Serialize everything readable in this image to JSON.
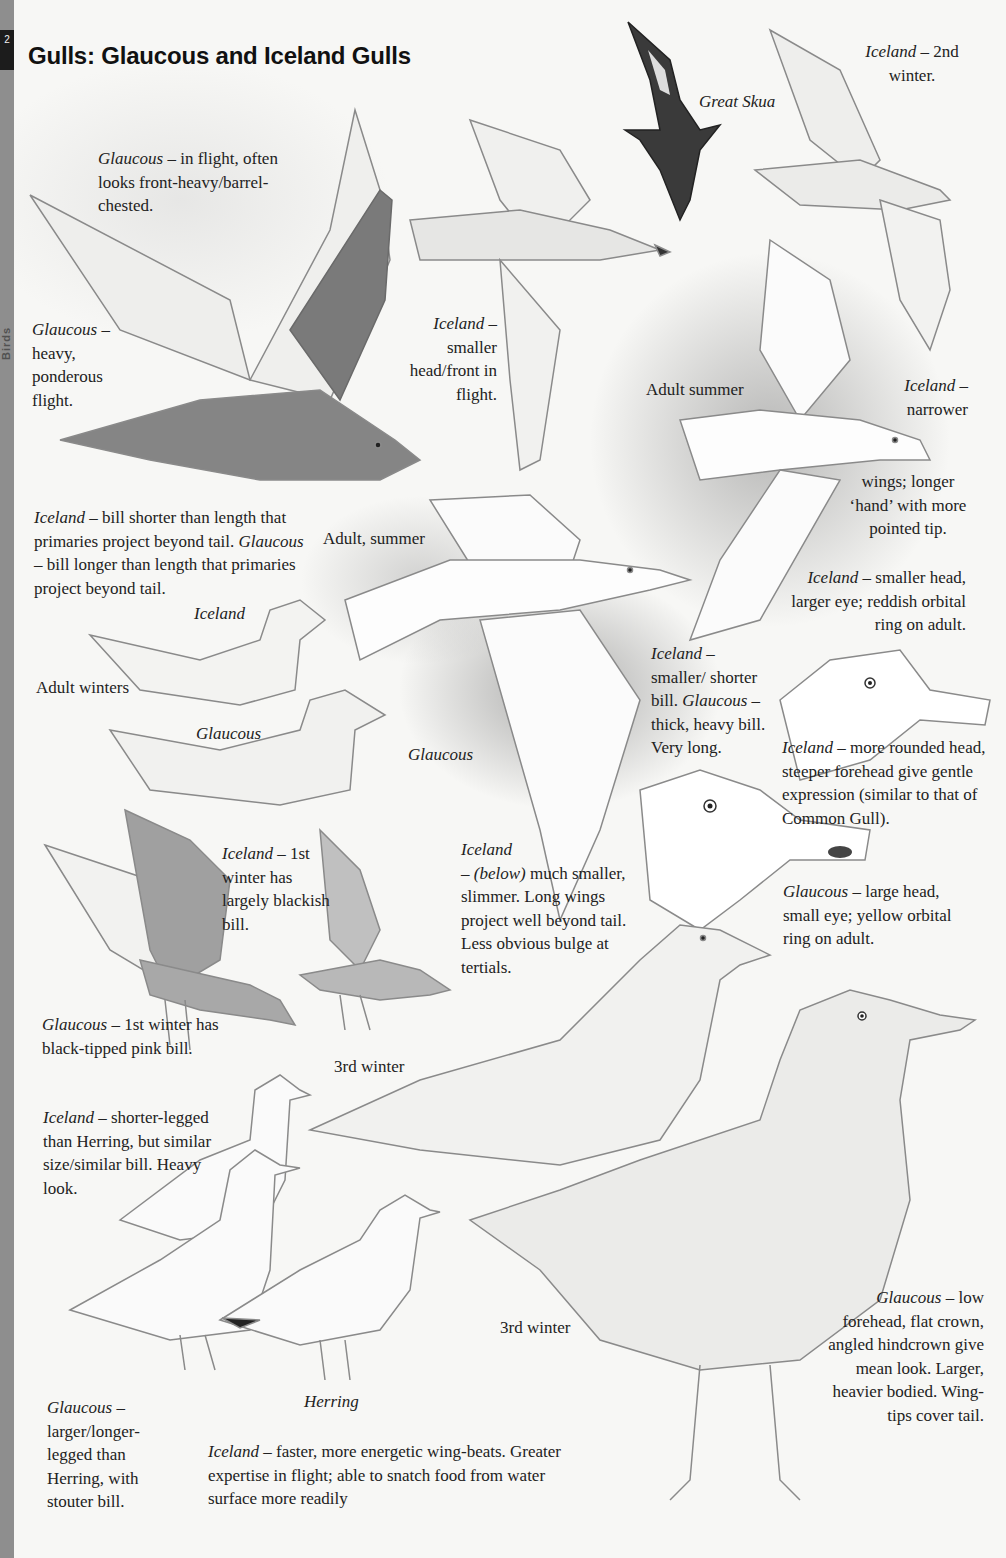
{
  "page": {
    "page_number": "2",
    "section_tab": "Birds",
    "title": "Gulls: Glaucous and Iceland Gulls"
  },
  "notes": {
    "glaucous_flight": {
      "species": "Glaucous",
      "text": " – in flight, often looks front-heavy/barrel-chested."
    },
    "glaucous_heavy": {
      "species": "Glaucous",
      "text": " – heavy, ponderous flight."
    },
    "iceland_smaller_head": {
      "species": "Iceland",
      "text": " – smaller head/front in flight."
    },
    "great_skua": {
      "label": "Great Skua"
    },
    "iceland_2nd_winter": {
      "species": "Iceland",
      "text": " – 2nd winter."
    },
    "adult_summer_right": {
      "label": "Adult summer"
    },
    "iceland_narrower": {
      "species": "Iceland",
      "text": " – narrower"
    },
    "iceland_wings_cont": {
      "text": "wings; longer ‘hand’ with more pointed tip."
    },
    "iceland_smaller_eye": {
      "species": "Iceland",
      "text": " – smaller head, larger eye; reddish orbital ring on adult."
    },
    "bill_comparison": {
      "iceland_species": "Iceland",
      "iceland_text": " – bill shorter than length that primaries project beyond tail.",
      "glaucous_species": "Glaucous",
      "glaucous_text": " – bill longer than length that primaries project beyond tail."
    },
    "adult_summer_mid": {
      "label": "Adult, summer"
    },
    "iceland_swimming": {
      "label": "Iceland"
    },
    "adult_winters": {
      "label": "Adult winters"
    },
    "glaucous_swimming": {
      "label": "Glaucous"
    },
    "glaucous_flying_mid": {
      "label": "Glaucous"
    },
    "bill_heads": {
      "iceland_species": "Iceland",
      "iceland_text": " – smaller/ shorter bill.",
      "glaucous_species": "Glaucous",
      "glaucous_text": " – thick, heavy bill. Very long."
    },
    "iceland_rounded_head": {
      "species": "Iceland",
      "text": " – more rounded head, steeper forehead give gentle expression (similar to that of Common Gull)."
    },
    "glaucous_large_head": {
      "species": "Glaucous",
      "text": " – large head, small eye; yellow orbital ring on adult."
    },
    "iceland_1st_winter": {
      "species": "Iceland",
      "text": " – 1st winter has largely blackish bill."
    },
    "glaucous_1st_winter": {
      "species": "Glaucous",
      "text": " – 1st winter has black-tipped pink bill."
    },
    "third_winter_left": {
      "label": "3rd winter"
    },
    "iceland_below": {
      "species": "Iceland",
      "below": "(below)",
      "text": "much smaller, slimmer. Long wings project well beyond tail. Less obvious bulge at tertials."
    },
    "iceland_shorter_legged": {
      "species": "Iceland",
      "text": " – shorter-legged than Herring, but similar size/similar bill. Heavy look."
    },
    "third_winter_right": {
      "label": "3rd winter"
    },
    "glaucous_longer_legged": {
      "species": "Glaucous",
      "text": " – larger/longer-legged than Herring, with stouter bill."
    },
    "herring": {
      "label": "Herring"
    },
    "iceland_wingbeats": {
      "species": "Iceland",
      "text": " – faster, more energetic wing-beats. Greater expertise in flight; able to snatch food from water surface more readily"
    },
    "glaucous_low_forehead": {
      "species": "Glaucous",
      "text": " – low forehead, flat crown, angled hindcrown give mean look. Larger, heavier bodied. Wing-tips cover tail."
    }
  },
  "colors": {
    "paper": "#f7f7f5",
    "tab": "#8e8e8e",
    "ink": "#222222",
    "wash": "#8a8a8a"
  }
}
